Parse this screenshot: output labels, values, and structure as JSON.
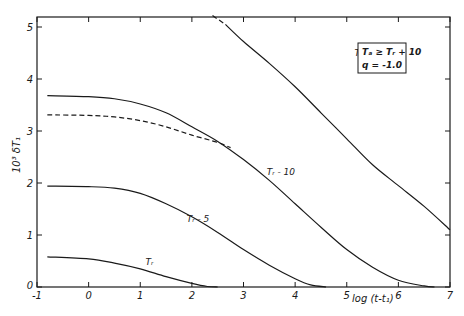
{
  "chart_data": {
    "type": "line",
    "title": "",
    "xlabel": "log (t-t₁)",
    "ylabel": "10³ δT₁",
    "xlim": [
      -1,
      7
    ],
    "ylim": [
      0,
      5.2
    ],
    "x_ticks": [
      -1,
      0,
      1,
      2,
      3,
      4,
      5,
      6,
      7
    ],
    "x_tick_labels": [
      "-1",
      "0",
      "1",
      "2",
      "3",
      "4",
      "5",
      "6",
      "7"
    ],
    "y_ticks": [
      0,
      1,
      2,
      3,
      4,
      5
    ],
    "y_tick_labels": [
      "0",
      "1",
      "2",
      "3",
      "4",
      "5"
    ],
    "grid": false,
    "legend": {
      "position": "upper right",
      "lines": [
        "Tₐ ≥ Tᵣ + 10",
        "q = -1.0"
      ]
    },
    "series": [
      {
        "name": "Tr - 15",
        "label": "Tᵣ - 15",
        "style": "solid",
        "label_pos": [
          5.15,
          4.45
        ],
        "points": [
          [
            2.65,
            5.05
          ],
          [
            3,
            4.72
          ],
          [
            3.5,
            4.3
          ],
          [
            4,
            3.85
          ],
          [
            4.5,
            3.35
          ],
          [
            5,
            2.85
          ],
          [
            5.5,
            2.35
          ],
          [
            6,
            1.95
          ],
          [
            6.5,
            1.55
          ],
          [
            7,
            1.1
          ]
        ]
      },
      {
        "name": "Tr - 15 (dashed extension)",
        "label": "",
        "style": "dashed",
        "points": [
          [
            2.4,
            5.22
          ],
          [
            2.65,
            5.05
          ]
        ]
      },
      {
        "name": "Tr - 10",
        "label": "Tᵣ - 10",
        "style": "solid",
        "label_pos": [
          3.45,
          2.15
        ],
        "points": [
          [
            -0.8,
            3.68
          ],
          [
            0,
            3.66
          ],
          [
            0.5,
            3.62
          ],
          [
            1,
            3.52
          ],
          [
            1.5,
            3.35
          ],
          [
            2,
            3.08
          ],
          [
            2.5,
            2.8
          ],
          [
            3,
            2.45
          ],
          [
            3.5,
            2.05
          ],
          [
            4,
            1.6
          ],
          [
            4.5,
            1.15
          ],
          [
            5,
            0.72
          ],
          [
            5.5,
            0.38
          ],
          [
            6,
            0.13
          ],
          [
            6.5,
            0.02
          ],
          [
            6.7,
            0
          ]
        ]
      },
      {
        "name": "Tr - 10 (dashed)",
        "label": "",
        "style": "dashed",
        "points": [
          [
            -0.8,
            3.31
          ],
          [
            0,
            3.3
          ],
          [
            0.5,
            3.27
          ],
          [
            1,
            3.2
          ],
          [
            1.5,
            3.08
          ],
          [
            2,
            2.92
          ],
          [
            2.5,
            2.78
          ],
          [
            2.75,
            2.68
          ]
        ]
      },
      {
        "name": "Tr - 5",
        "label": "Tᵣ - 5",
        "style": "solid",
        "label_pos": [
          1.9,
          1.25
        ],
        "points": [
          [
            -0.8,
            1.94
          ],
          [
            0,
            1.93
          ],
          [
            0.5,
            1.9
          ],
          [
            1,
            1.8
          ],
          [
            1.5,
            1.6
          ],
          [
            2,
            1.35
          ],
          [
            2.5,
            1.05
          ],
          [
            3,
            0.72
          ],
          [
            3.5,
            0.42
          ],
          [
            4,
            0.16
          ],
          [
            4.3,
            0.04
          ],
          [
            4.6,
            0
          ]
        ]
      },
      {
        "name": "Tr",
        "label": "Tᵣ",
        "style": "solid",
        "label_pos": [
          1.1,
          0.42
        ],
        "points": [
          [
            -0.8,
            0.58
          ],
          [
            0,
            0.54
          ],
          [
            0.5,
            0.46
          ],
          [
            1,
            0.35
          ],
          [
            1.5,
            0.2
          ],
          [
            2,
            0.07
          ],
          [
            2.3,
            0.01
          ],
          [
            2.5,
            0
          ]
        ]
      }
    ]
  },
  "layout": {
    "plot_left": 37,
    "plot_right": 450,
    "plot_top": 17,
    "plot_bottom": 287,
    "line_color": "#1a1a1a"
  }
}
